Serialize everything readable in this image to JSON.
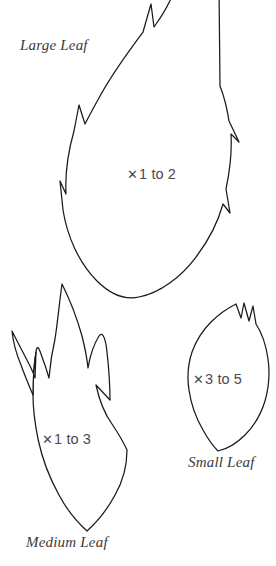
{
  "sheet": {
    "background_color": "#ffffff",
    "outline_color": "#1a1a1a",
    "text_color": "#3b3b3b",
    "quantity_text_color": "#4a4a4a"
  },
  "templates": [
    {
      "id": "large-leaf",
      "name": "Large Leaf",
      "quantity_symbol": "✕",
      "quantity_text": "1 to 2",
      "quantity_full": "✕1 to 2",
      "shape": "flame-leaf-serrated"
    },
    {
      "id": "medium-leaf",
      "name": "Medium Leaf",
      "quantity_symbol": "✕",
      "quantity_text": "1 to 3",
      "quantity_full": "✕1 to 3",
      "shape": "flame-leaf-pointed-lobes"
    },
    {
      "id": "small-leaf",
      "name": "Small Leaf",
      "quantity_symbol": "✕",
      "quantity_text": "3 to 5",
      "quantity_full": "✕3 to 5",
      "shape": "pointed-oval-notched"
    }
  ]
}
